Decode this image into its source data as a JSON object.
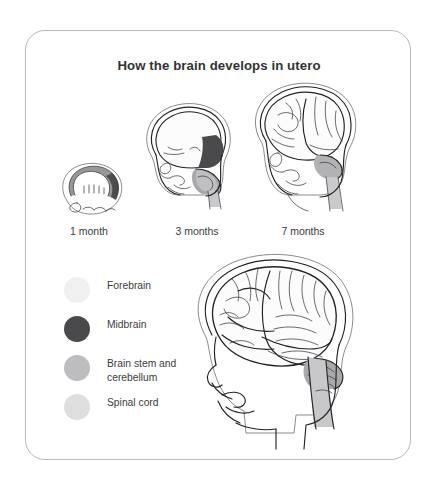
{
  "figure": {
    "title": "How the brain develops in utero",
    "card_border_color": "#b9b9bd",
    "background_color": "#ffffff",
    "text_color": "#3c3c40"
  },
  "stages": [
    {
      "label": "1 month",
      "icon": "embryo-brain-1-month-icon"
    },
    {
      "label": "3 months",
      "icon": "fetal-head-brain-3-months-icon"
    },
    {
      "label": "7 months",
      "icon": "fetal-head-brain-7-months-icon"
    }
  ],
  "legend": {
    "items": [
      {
        "label": "Forebrain",
        "color": "#f0f0f0",
        "swatch_name": "legend-swatch-forebrain"
      },
      {
        "label": "Midbrain",
        "color": "#4a4a4c",
        "swatch_name": "legend-swatch-midbrain"
      },
      {
        "label": "Brain stem and cerebellum",
        "color": "#bdbdbf",
        "swatch_name": "legend-swatch-brainstem-cerebellum"
      },
      {
        "label": "Spinal cord",
        "color": "#dedede",
        "swatch_name": "legend-swatch-spinal-cord"
      }
    ]
  },
  "main_illustration": {
    "icon": "child-head-brain-profile-icon",
    "forebrain_color": "#fbfbfb",
    "midbrain_color": "#4a4a4c",
    "cerebellum_color": "#b4b4b6",
    "spinal_cord_color": "#d3d3d5"
  }
}
